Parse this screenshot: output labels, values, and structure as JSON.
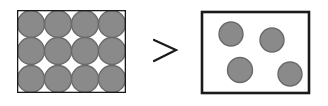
{
  "diagram": {
    "colors": {
      "border": "#1a1a1a",
      "particle_fill": "#8a8a8a",
      "particle_stroke": "#6a6a6a",
      "background": "#ffffff"
    },
    "left_box": {
      "label": "densely packed particles",
      "x": 17,
      "y": 10,
      "w": 109,
      "h": 83,
      "rows": 3,
      "cols": 4,
      "particles": [
        {
          "cx": 31,
          "cy": 24,
          "r": 13.5
        },
        {
          "cx": 58,
          "cy": 24,
          "r": 13.5
        },
        {
          "cx": 85,
          "cy": 24,
          "r": 13.5
        },
        {
          "cx": 112,
          "cy": 24,
          "r": 13.5
        },
        {
          "cx": 31,
          "cy": 51,
          "r": 13.5
        },
        {
          "cx": 58,
          "cy": 51,
          "r": 13.5
        },
        {
          "cx": 85,
          "cy": 51,
          "r": 13.5
        },
        {
          "cx": 112,
          "cy": 51,
          "r": 13.5
        },
        {
          "cx": 31,
          "cy": 79,
          "r": 13.5
        },
        {
          "cx": 58,
          "cy": 79,
          "r": 13.5
        },
        {
          "cx": 85,
          "cy": 79,
          "r": 13.5
        },
        {
          "cx": 112,
          "cy": 79,
          "r": 13.5
        }
      ]
    },
    "comparison_symbol": ">",
    "right_box": {
      "label": "sparse particles",
      "x": 202,
      "y": 12,
      "w": 107,
      "h": 81,
      "particles": [
        {
          "cx": 231,
          "cy": 34,
          "r": 12
        },
        {
          "cx": 272,
          "cy": 40,
          "r": 12
        },
        {
          "cx": 240,
          "cy": 70,
          "r": 12.5
        },
        {
          "cx": 290,
          "cy": 74,
          "r": 12
        }
      ]
    }
  }
}
